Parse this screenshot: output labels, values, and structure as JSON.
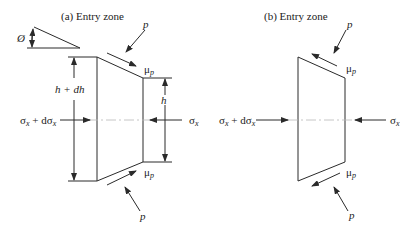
{
  "panels": [
    {
      "id": "a",
      "title": "(a) Entry zone",
      "angle_label": "Ø",
      "pressure_top": "p",
      "pressure_bottom": "p",
      "friction_top": "μ",
      "friction_top_sub": "p",
      "friction_bottom": "μ",
      "friction_bottom_sub": "p",
      "entry_height_label": "h + dh",
      "exit_height_label": "h",
      "left_stress": "σ",
      "left_stress_sub": "x",
      "left_stress_plus": " + dσ",
      "left_stress_plus_sub": "x",
      "right_stress": "σ",
      "right_stress_sub": "x"
    },
    {
      "id": "b",
      "title": "(b) Entry zone",
      "pressure_top": "p",
      "pressure_bottom": "p",
      "friction_top": "μ",
      "friction_top_sub": "p",
      "friction_bottom": "μ",
      "friction_bottom_sub": "p",
      "left_stress": "σ",
      "left_stress_sub": "x",
      "left_stress_plus": " + dσ",
      "left_stress_plus_sub": "x",
      "right_stress": "σ",
      "right_stress_sub": "x"
    }
  ]
}
